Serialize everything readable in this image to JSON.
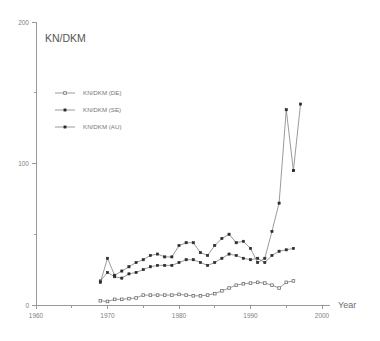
{
  "chart_data": {
    "type": "line",
    "title": "KN/DKM",
    "xlabel": "Year",
    "ylabel": "",
    "xlim": [
      1960,
      2000
    ],
    "ylim": [
      0,
      200
    ],
    "xticks": [
      1960,
      1970,
      1980,
      1990,
      2000
    ],
    "xticks_minor": [
      1965,
      1975,
      1985,
      1995
    ],
    "yticks": [
      0,
      100,
      200
    ],
    "yticks_minor": [
      50,
      150
    ],
    "grid": false,
    "legend_position": "upper-left",
    "series": [
      {
        "name": "KN/DKM (DE)",
        "marker": "open-square",
        "x": [
          1969,
          1970,
          1971,
          1972,
          1973,
          1974,
          1975,
          1976,
          1977,
          1978,
          1979,
          1980,
          1981,
          1982,
          1983,
          1984,
          1985,
          1986,
          1987,
          1988,
          1989,
          1990,
          1991,
          1992,
          1993,
          1994,
          1995,
          1996
        ],
        "values": [
          3,
          2.5,
          4,
          4,
          4.5,
          5,
          7,
          7,
          7,
          7,
          7,
          7.5,
          7,
          6.5,
          6.5,
          7,
          8,
          10,
          12,
          14,
          15,
          15.5,
          16,
          15.5,
          14,
          12,
          16,
          17
        ]
      },
      {
        "name": "KN/DKM (SE)",
        "marker": "filled-square",
        "x": [
          1969,
          1970,
          1971,
          1972,
          1973,
          1974,
          1975,
          1976,
          1977,
          1978,
          1979,
          1980,
          1981,
          1982,
          1983,
          1984,
          1985,
          1986,
          1987,
          1988,
          1989,
          1990,
          1991,
          1992,
          1993,
          1994,
          1995,
          1996
        ],
        "values": [
          17,
          23,
          20,
          19,
          22,
          23,
          25,
          27,
          28,
          28,
          28,
          30,
          32,
          32,
          30,
          28,
          30,
          33,
          36,
          35,
          33,
          32,
          33,
          30,
          35,
          38,
          39,
          40
        ]
      },
      {
        "name": "KN/DKM (AU)",
        "marker": "filled-square",
        "x": [
          1969,
          1970,
          1971,
          1972,
          1973,
          1974,
          1975,
          1976,
          1977,
          1978,
          1979,
          1980,
          1981,
          1982,
          1983,
          1984,
          1985,
          1986,
          1987,
          1988,
          1989,
          1990,
          1991,
          1992,
          1993,
          1994,
          1995,
          1996
        ],
        "values": [
          16,
          33,
          21,
          24,
          27,
          30,
          32,
          35,
          36,
          34,
          34,
          42,
          44,
          44,
          37,
          35,
          42,
          47,
          50,
          44,
          45,
          40,
          30,
          33,
          52,
          72,
          138,
          95
        ]
      },
      {
        "name": "KN/DKM (AU) continued",
        "marker": "filled-square",
        "x": [
          1996,
          1997
        ],
        "values": [
          95,
          142
        ]
      }
    ]
  },
  "title": "KN/DKM",
  "axes": {
    "x_label": "Year",
    "x_tick_labels": [
      "1960",
      "1970",
      "1980",
      "1990",
      "2000"
    ],
    "y_tick_labels": [
      "0",
      "100",
      "200"
    ]
  },
  "legend": {
    "items": [
      {
        "label": "KN/DKM (DE)"
      },
      {
        "label": "KN/DKM (SE)"
      },
      {
        "label": "KN/DKM (AU)"
      }
    ]
  }
}
